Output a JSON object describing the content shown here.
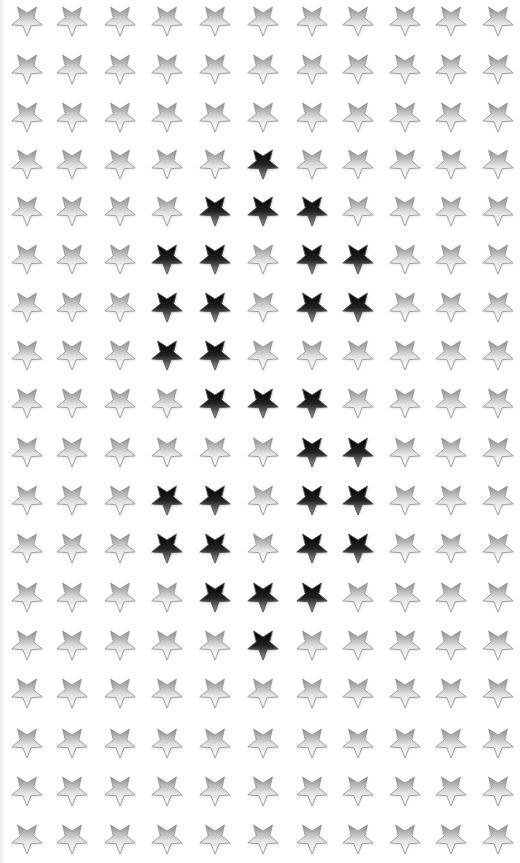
{
  "board": {
    "rows": 18,
    "cols": 11,
    "col_x": [
      27,
      72,
      120,
      167,
      215,
      263,
      312,
      358,
      405,
      451,
      498
    ],
    "row_y": [
      20,
      68,
      116,
      163,
      210,
      258,
      306,
      354,
      402,
      451,
      499,
      547,
      596,
      644,
      692,
      742,
      790,
      838
    ],
    "icon": "star-icon",
    "active": [
      [
        3,
        5
      ],
      [
        4,
        4
      ],
      [
        4,
        5
      ],
      [
        4,
        6
      ],
      [
        5,
        3
      ],
      [
        5,
        4
      ],
      [
        5,
        6
      ],
      [
        5,
        7
      ],
      [
        6,
        3
      ],
      [
        6,
        4
      ],
      [
        6,
        6
      ],
      [
        6,
        7
      ],
      [
        7,
        3
      ],
      [
        7,
        4
      ],
      [
        8,
        4
      ],
      [
        8,
        5
      ],
      [
        8,
        6
      ],
      [
        9,
        6
      ],
      [
        9,
        7
      ],
      [
        10,
        3
      ],
      [
        10,
        4
      ],
      [
        10,
        6
      ],
      [
        10,
        7
      ],
      [
        11,
        3
      ],
      [
        11,
        4
      ],
      [
        11,
        6
      ],
      [
        11,
        7
      ],
      [
        12,
        4
      ],
      [
        12,
        5
      ],
      [
        12,
        6
      ],
      [
        13,
        5
      ]
    ]
  },
  "colors": {
    "inactive_top": "#8a8a8a",
    "inactive_bottom": "#ffffff",
    "inactive_stroke": "#9a9a9a",
    "active_top": "#000000",
    "active_bottom": "#9a9a9a",
    "background": "#ffffff"
  }
}
